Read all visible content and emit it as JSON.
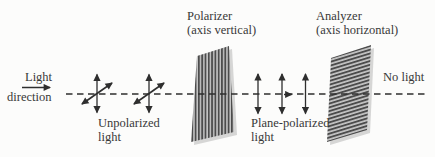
{
  "figure": {
    "type": "optics-polarization-diagram",
    "labels": {
      "light_direction": {
        "line1": "Light",
        "line2": "direction"
      },
      "unpolarized": {
        "line1": "Unpolarized",
        "line2": "light"
      },
      "polarizer": {
        "line1": "Polarizer",
        "line2": "(axis vertical)"
      },
      "analyzer": {
        "line1": "Analyzer",
        "line2": "(axis horizontal)"
      },
      "plane_polarized": {
        "line1": "Plane-polarized",
        "line2": "light"
      },
      "no_light": "No light"
    }
  },
  "colors": {
    "background": "#fcfcfb",
    "text": "#383838",
    "ink": "#2e2e2e",
    "stripe-dark": "#4c4c4c",
    "stripe-light": "#c6c6c6",
    "shadow": "#b6b6b6"
  }
}
